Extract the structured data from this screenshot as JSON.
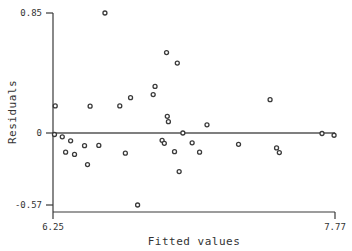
{
  "chart_data": {
    "type": "scatter",
    "title": "",
    "xlabel": "Fitted values",
    "ylabel": "Residuals",
    "xlim": [
      6.25,
      7.77
    ],
    "ylim": [
      -0.57,
      0.85
    ],
    "xticks": [
      6.25,
      7.77
    ],
    "xtick_labels": [
      "6.25",
      "7.77"
    ],
    "yticks": [
      -0.57,
      0,
      0.85
    ],
    "ytick_labels": [
      "-0.57",
      "0",
      "0.85"
    ],
    "grid": false,
    "legend": null,
    "reference_line": {
      "orientation": "horizontal",
      "y": 0,
      "label": "zero-residual-line"
    },
    "marker": {
      "shape": "circle",
      "filled": false,
      "size": 4,
      "color": "#3a3a3a"
    },
    "points": [
      {
        "x": 6.258,
        "y": -0.012
      },
      {
        "x": 6.262,
        "y": 0.192
      },
      {
        "x": 6.3,
        "y": -0.03
      },
      {
        "x": 6.318,
        "y": -0.152
      },
      {
        "x": 6.345,
        "y": -0.062
      },
      {
        "x": 6.366,
        "y": -0.17
      },
      {
        "x": 6.42,
        "y": -0.1
      },
      {
        "x": 6.436,
        "y": -0.25
      },
      {
        "x": 6.45,
        "y": 0.19
      },
      {
        "x": 6.497,
        "y": -0.098
      },
      {
        "x": 6.53,
        "y": 0.85
      },
      {
        "x": 6.61,
        "y": 0.192
      },
      {
        "x": 6.64,
        "y": -0.16
      },
      {
        "x": 6.668,
        "y": 0.25
      },
      {
        "x": 6.706,
        "y": -0.57
      },
      {
        "x": 6.79,
        "y": 0.272
      },
      {
        "x": 6.8,
        "y": 0.33
      },
      {
        "x": 6.838,
        "y": -0.058
      },
      {
        "x": 6.85,
        "y": -0.082
      },
      {
        "x": 6.862,
        "y": 0.57
      },
      {
        "x": 6.866,
        "y": 0.118
      },
      {
        "x": 6.872,
        "y": 0.08
      },
      {
        "x": 6.905,
        "y": -0.148
      },
      {
        "x": 6.92,
        "y": 0.495
      },
      {
        "x": 6.93,
        "y": -0.305
      },
      {
        "x": 6.95,
        "y": 0.0
      },
      {
        "x": 7.0,
        "y": -0.078
      },
      {
        "x": 7.04,
        "y": -0.152
      },
      {
        "x": 7.08,
        "y": 0.058
      },
      {
        "x": 7.25,
        "y": -0.09
      },
      {
        "x": 7.42,
        "y": 0.236
      },
      {
        "x": 7.455,
        "y": -0.118
      },
      {
        "x": 7.47,
        "y": -0.155
      },
      {
        "x": 7.7,
        "y": -0.004
      },
      {
        "x": 7.765,
        "y": -0.018
      }
    ]
  }
}
